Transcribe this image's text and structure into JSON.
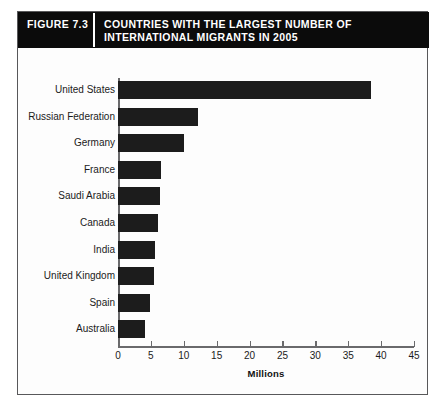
{
  "header": {
    "figure_number": "FIGURE 7.3",
    "title": "COUNTRIES WITH THE LARGEST NUMBER OF INTERNATIONAL MIGRANTS IN 2005"
  },
  "colors": {
    "banner_background": "#0b0b0b",
    "banner_text": "#ffffff",
    "bar_fill": "#1c1c1c",
    "axis_line": "#6a6a6c",
    "frame_border": "#58585a",
    "page_background": "#ffffff"
  },
  "chart_data": {
    "type": "bar",
    "orientation": "horizontal",
    "title": "COUNTRIES WITH THE LARGEST NUMBER OF INTERNATIONAL MIGRANTS IN 2005",
    "xlabel": "Millions",
    "ylabel": "",
    "xlim": [
      0,
      45
    ],
    "xticks": [
      0,
      5,
      10,
      15,
      20,
      25,
      30,
      35,
      40,
      45
    ],
    "xtick_labels": [
      "0",
      "5",
      "10",
      "15",
      "20",
      "25",
      "30",
      "35",
      "40",
      "45"
    ],
    "grid": false,
    "legend": false,
    "categories": [
      "United States",
      "Russian Federation",
      "Germany",
      "France",
      "Saudi Arabia",
      "Canada",
      "India",
      "United Kingdom",
      "Spain",
      "Australia"
    ],
    "values": [
      38.4,
      12.1,
      10.1,
      6.5,
      6.4,
      6.1,
      5.7,
      5.4,
      4.8,
      4.1
    ],
    "units": "millions of international migrants"
  }
}
